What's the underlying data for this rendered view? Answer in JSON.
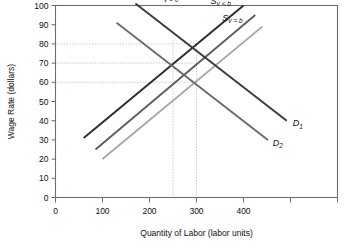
{
  "chart_data": {
    "type": "line",
    "title": "",
    "xlabel": "Quantity of Labor (labor units)",
    "ylabel": "Wage Rate (dollars)",
    "xlim": [
      0,
      600
    ],
    "ylim": [
      0,
      100
    ],
    "xticks": [
      0,
      100,
      200,
      300,
      400,
      500,
      600
    ],
    "xticklabels": [
      "0",
      "100",
      "200",
      "300",
      "400",
      "",
      ""
    ],
    "yticks": [
      0,
      10,
      20,
      30,
      40,
      50,
      60,
      70,
      80,
      90,
      100
    ],
    "yticklabels": [
      "0",
      "10",
      "20",
      "30",
      "40",
      "50",
      "60",
      "70",
      "80",
      "90",
      "100"
    ],
    "grid": false,
    "legend": "inline-labels",
    "series": [
      {
        "name": "S_v=0",
        "label": "S",
        "sublabel": "v = 0",
        "kind": "supply",
        "color": "#2b2b2b",
        "points": [
          [
            60,
            31
          ],
          [
            400,
            100
          ]
        ]
      },
      {
        "name": "S_v<b",
        "label": "S",
        "sublabel": "v < b",
        "kind": "supply",
        "color": "#5d5d5d",
        "points": [
          [
            85,
            25
          ],
          [
            425,
            95
          ]
        ]
      },
      {
        "name": "S_v=b",
        "label": "S",
        "sublabel": "v = b",
        "kind": "supply",
        "color": "#a6a6a6",
        "points": [
          [
            100,
            20
          ],
          [
            440,
            89
          ]
        ]
      },
      {
        "name": "D_1",
        "label": "D",
        "sublabel": "1",
        "kind": "demand",
        "color": "#3a3a3a",
        "points": [
          [
            170,
            101
          ],
          [
            492,
            40
          ]
        ]
      },
      {
        "name": "D_2",
        "label": "D",
        "sublabel": "2",
        "kind": "demand",
        "color": "#6a6a6a",
        "points": [
          [
            130,
            91
          ],
          [
            452,
            30
          ]
        ]
      }
    ],
    "guide_lines": {
      "horizontal_values": [
        80,
        70,
        60
      ],
      "vertical_values": [
        250,
        300
      ]
    },
    "annotations": [
      {
        "name": "label-s-v-0",
        "text": "S",
        "sub": "v = 0",
        "x": 218,
        "y": 103
      },
      {
        "name": "label-s-v-lt-b",
        "text": "S",
        "sub": "v < b",
        "x": 330,
        "y": 101
      },
      {
        "name": "label-s-v-b",
        "text": "S",
        "sub": "v = b",
        "x": 355,
        "y": 92
      },
      {
        "name": "label-d-1",
        "text": "D",
        "sub": "1",
        "x": 505,
        "y": 37
      },
      {
        "name": "label-d-2",
        "text": "D",
        "sub": "2",
        "x": 462,
        "y": 27
      }
    ]
  }
}
